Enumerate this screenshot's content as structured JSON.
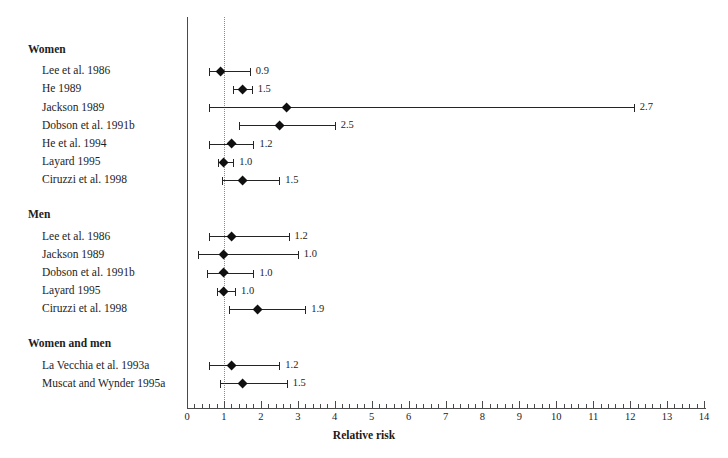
{
  "chart_data": {
    "type": "scatter",
    "title": "",
    "xlabel": "Relative risk",
    "ylabel": "",
    "xlim": [
      0,
      14
    ],
    "xticks": [
      0,
      1,
      2,
      3,
      4,
      5,
      6,
      7,
      8,
      9,
      10,
      11,
      12,
      13,
      14
    ],
    "xtick_labels": [
      "0",
      "1",
      "2",
      "3",
      "4",
      "5",
      "6",
      "7",
      "8",
      "9",
      "10",
      "11",
      "12",
      "13",
      "14"
    ],
    "minor_tick_step": 0.2,
    "grid": false,
    "legend": "none",
    "reference_line": 1.0,
    "reference_line_style": "dotted",
    "marker": "diamond",
    "groups": [
      {
        "label": "Women",
        "rows": [
          {
            "study": "Lee et al. 1986",
            "estimate": 0.9,
            "value_label": "0.9",
            "ci_low": 0.6,
            "ci_high": 1.7
          },
          {
            "study": "He 1989",
            "estimate": 1.5,
            "value_label": "1.5",
            "ci_low": 1.25,
            "ci_high": 1.75
          },
          {
            "study": "Jackson 1989",
            "estimate": 2.7,
            "value_label": "2.7",
            "ci_low": 0.6,
            "ci_high": 12.1
          },
          {
            "study": "Dobson et al. 1991b",
            "estimate": 2.5,
            "value_label": "2.5",
            "ci_low": 1.4,
            "ci_high": 4.0
          },
          {
            "study": "He et al. 1994",
            "estimate": 1.2,
            "value_label": "1.2",
            "ci_low": 0.6,
            "ci_high": 1.8
          },
          {
            "study": "Layard 1995",
            "estimate": 1.0,
            "value_label": "1.0",
            "ci_low": 0.85,
            "ci_high": 1.25
          },
          {
            "study": "Ciruzzi et al. 1998",
            "estimate": 1.5,
            "value_label": "1.5",
            "ci_low": 0.95,
            "ci_high": 2.5
          }
        ]
      },
      {
        "label": "Men",
        "rows": [
          {
            "study": "Lee et al. 1986",
            "estimate": 1.2,
            "value_label": "1.2",
            "ci_low": 0.6,
            "ci_high": 2.75
          },
          {
            "study": "Jackson 1989",
            "estimate": 1.0,
            "value_label": "1.0",
            "ci_low": 0.3,
            "ci_high": 3.0
          },
          {
            "study": "Dobson et al. 1991b",
            "estimate": 1.0,
            "value_label": "1.0",
            "ci_low": 0.55,
            "ci_high": 1.8
          },
          {
            "study": "Layard 1995",
            "estimate": 1.0,
            "value_label": "1.0",
            "ci_low": 0.8,
            "ci_high": 1.3
          },
          {
            "study": "Ciruzzi et al. 1998",
            "estimate": 1.9,
            "value_label": "1.9",
            "ci_low": 1.15,
            "ci_high": 3.2
          }
        ]
      },
      {
        "label": "Women and men",
        "rows": [
          {
            "study": "La Vecchia et al. 1993a",
            "estimate": 1.2,
            "value_label": "1.2",
            "ci_low": 0.6,
            "ci_high": 2.5
          },
          {
            "study": "Muscat and Wynder 1995a",
            "estimate": 1.5,
            "value_label": "1.5",
            "ci_low": 0.9,
            "ci_high": 2.7
          }
        ]
      }
    ]
  },
  "colors": {
    "marker": "#101010",
    "line": "#242424",
    "axis": "#4a4a4a",
    "reference": "#8a8a8a",
    "text": "#1d1d1d",
    "background": "#ffffff"
  }
}
